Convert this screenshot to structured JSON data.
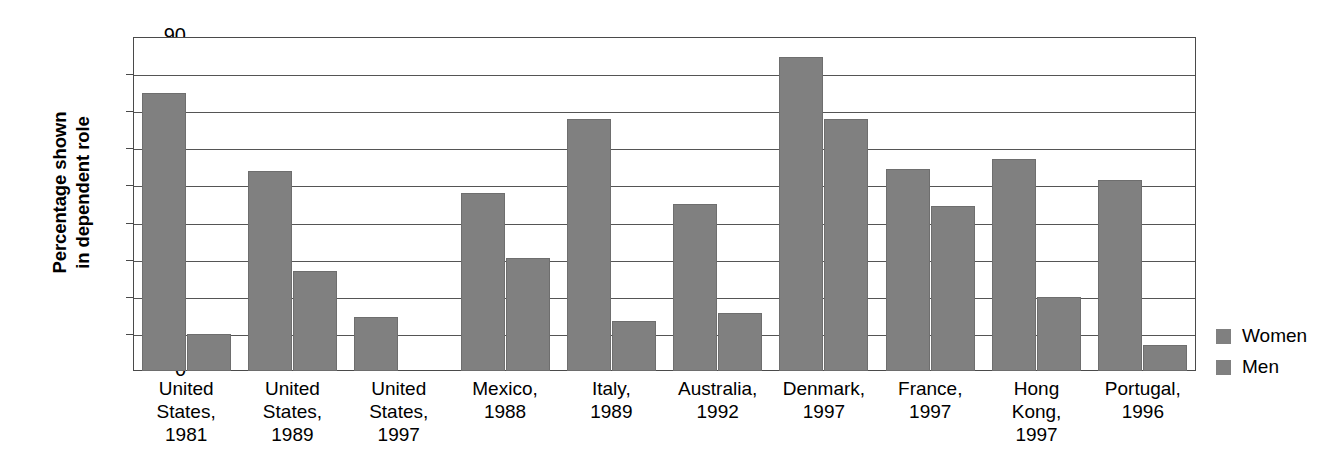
{
  "chart_data": {
    "type": "bar",
    "title": "",
    "xlabel": "",
    "ylabel": "Percentage shown in dependent role",
    "ylabel_lines": [
      "Percentage shown",
      "in dependent role"
    ],
    "ylim": [
      0,
      90
    ],
    "ytick_step": 10,
    "yticks": [
      90,
      80,
      70,
      60,
      50,
      40,
      30,
      20,
      10,
      0
    ],
    "grid": true,
    "grid_axis": "y",
    "legend_position": "right",
    "bar_color": "#808080",
    "frame_color": "#4a4a4a",
    "categories": [
      "United States, 1981",
      "United States, 1989",
      "United States, 1997",
      "Mexico, 1988",
      "Italy, 1989",
      "Australia, 1992",
      "Denmark, 1997",
      "France, 1997",
      "Hong Kong, 1997",
      "Portugal, 1996"
    ],
    "category_label_lines": [
      [
        "United",
        "States,",
        "1981"
      ],
      [
        "United",
        "States,",
        "1989"
      ],
      [
        "United",
        "States,",
        "1997"
      ],
      [
        "Mexico,",
        "1988"
      ],
      [
        "Italy,",
        "1989"
      ],
      [
        "Australia,",
        "1992"
      ],
      [
        "Denmark,",
        "1997"
      ],
      [
        "France,",
        "1997"
      ],
      [
        "Hong",
        "Kong,",
        "1997"
      ],
      [
        "Portugal,",
        "1996"
      ]
    ],
    "series": [
      {
        "name": "Women",
        "color": "#808080",
        "values": [
          75,
          54,
          14.5,
          48,
          68,
          45,
          84.5,
          54.5,
          57,
          51.5
        ]
      },
      {
        "name": "Men",
        "color": "#808080",
        "values": [
          10,
          27,
          null,
          30.5,
          13.5,
          15.5,
          68,
          44.5,
          20,
          7
        ]
      }
    ]
  },
  "legend": {
    "items": [
      {
        "label": "Women"
      },
      {
        "label": "Men"
      }
    ]
  }
}
